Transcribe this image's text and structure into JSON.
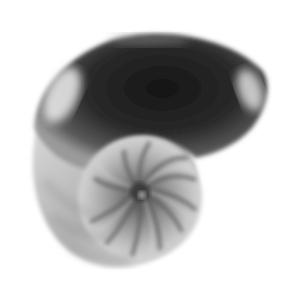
{
  "image": {
    "subject": "nautilus-shell",
    "background": "#ffffff",
    "palette": {
      "dark_body": "#1e1e1e",
      "mid_body": "#3a3a3a",
      "highlight": "#e6e6e6",
      "chamber_light": "#bdbdbd",
      "chamber_dark": "#5a5a5a"
    }
  }
}
